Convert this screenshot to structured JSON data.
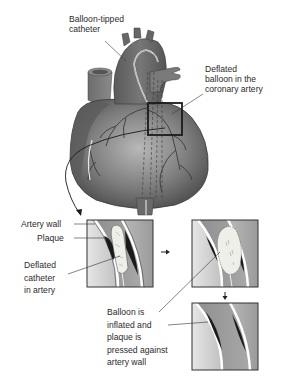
{
  "figure": {
    "labels": {
      "balloon_tipped_catheter": "Balloon-tipped\ncatheter",
      "deflated_balloon": "Deflated\nballoon in the\ncoronary artery",
      "artery_wall": "Artery wall",
      "plaque": "Plaque",
      "deflated_catheter": "Deflated\ncatheter\nin artery",
      "balloon_inflated": "Balloon is\ninflated and\nplaque is\npressed against\nartery wall"
    },
    "steps": [
      {
        "id": 1,
        "name": "deflated-catheter-panel"
      },
      {
        "id": 2,
        "name": "inflated-balloon-panel"
      },
      {
        "id": 3,
        "name": "widened-artery-panel"
      }
    ],
    "arrows": [
      "right-arrow",
      "down-arrow"
    ],
    "colors": {
      "heart_dark": "#4a4a4a",
      "heart_mid": "#7a7a7a",
      "heart_light": "#b5b5b5",
      "plaque": "#1c1c1c",
      "balloon": "#ebebe6",
      "panel_border": "#333333",
      "text": "#2b2b2b"
    }
  }
}
